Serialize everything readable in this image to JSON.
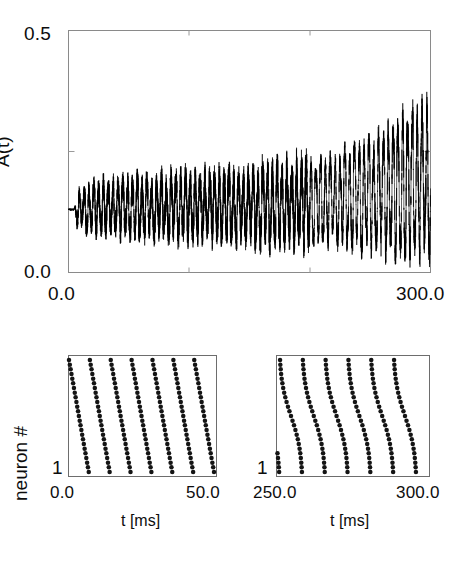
{
  "figure": {
    "title": "",
    "panels": [
      "activity-trace",
      "raster-early",
      "raster-late"
    ]
  },
  "top_panel": {
    "name": "population-activity",
    "ylabel": "A(t)",
    "y_ticks": [
      "0.0",
      "0.5"
    ],
    "x_ticks": [
      "0.0",
      "300.0"
    ],
    "ylim": [
      0.0,
      0.5
    ],
    "xlim": [
      0.0,
      300.0
    ]
  },
  "left_panel": {
    "name": "raster-early",
    "ylabel": "neuron #",
    "y_ticks": [
      "1"
    ],
    "x_ticks": [
      "0.0",
      "50.0"
    ],
    "xlabel": "t [ms]",
    "xlim": [
      0.0,
      50.0
    ]
  },
  "right_panel": {
    "name": "raster-late",
    "y_ticks": [
      "1"
    ],
    "x_ticks": [
      "250.0",
      "300.0"
    ],
    "xlabel": "t [ms]",
    "xlim": [
      250.0,
      300.0
    ]
  },
  "colors": {
    "trace": "#000000",
    "frame": "#8a8a8a",
    "dot": "#141414",
    "background": "#ffffff",
    "text": "#0d0d0d"
  },
  "chart_data": [
    {
      "type": "line",
      "name": "population-activity-trace",
      "title": "",
      "xlabel": "",
      "ylabel": "A(t)",
      "xlim": [
        0.0,
        300.0
      ],
      "ylim": [
        0.0,
        0.5
      ],
      "xticks": [
        0.0,
        300.0
      ],
      "yticks": [
        0.0,
        0.5
      ],
      "minor_xticks": [
        100.0,
        200.0
      ],
      "minor_yticks": [
        0.25
      ],
      "grid": false,
      "legend": null,
      "description": "Population activity A(t) of a network of spiking neurons. Starts at a flat steady value near 0.13 for t<5 ms, then develops noisy oscillations whose amplitude grows slowly until about t=200 ms and then grows rapidly, reaching peaks near 0.36 and troughs near 0.02 by t=300 ms.",
      "baseline": 0.13,
      "oscillation_period_ms": 4.0,
      "series": [
        {
          "name": "A(t)",
          "envelope_upper_x": [
            0,
            5,
            20,
            40,
            60,
            80,
            100,
            120,
            140,
            160,
            180,
            200,
            220,
            240,
            260,
            275,
            285,
            292,
            297,
            300
          ],
          "envelope_upper_y": [
            0.13,
            0.155,
            0.175,
            0.185,
            0.185,
            0.19,
            0.195,
            0.197,
            0.2,
            0.205,
            0.21,
            0.225,
            0.24,
            0.26,
            0.29,
            0.315,
            0.335,
            0.35,
            0.355,
            0.36
          ],
          "envelope_lower_x": [
            0,
            5,
            20,
            40,
            60,
            80,
            100,
            120,
            140,
            160,
            180,
            200,
            220,
            240,
            260,
            275,
            285,
            292,
            297,
            300
          ],
          "envelope_lower_y": [
            0.13,
            0.105,
            0.09,
            0.085,
            0.085,
            0.08,
            0.08,
            0.078,
            0.075,
            0.072,
            0.07,
            0.065,
            0.06,
            0.055,
            0.045,
            0.035,
            0.03,
            0.025,
            0.022,
            0.05
          ]
        }
      ]
    },
    {
      "type": "scatter",
      "name": "raster-early",
      "title": "",
      "xlabel": "t [ms]",
      "ylabel": "neuron #",
      "xlim": [
        0.0,
        50.0
      ],
      "ylim": [
        0.0,
        1.0
      ],
      "xticks": [
        0.0,
        50.0
      ],
      "yticks": [
        1
      ],
      "grid": false,
      "description": "Spike raster of 25 neurons over the first 50 ms. Seven nearly straight, steeply tilted stripes of spikes, each lasting about 7 ms and repeating every about 7 ms; neurons with higher index fire first, so the stripes slant down to the right.",
      "n_neurons": 25,
      "n_stripes": 7,
      "stripe_onsets_ms": [
        0.0,
        7.1,
        14.2,
        21.3,
        28.4,
        35.5,
        42.6
      ],
      "stripe_slope_ms_per_neuron": 0.28,
      "stripe_shape": "linear"
    },
    {
      "type": "scatter",
      "name": "raster-late",
      "title": "",
      "xlabel": "t [ms]",
      "ylabel": "",
      "xlim": [
        250.0,
        300.0
      ],
      "ylim": [
        0.0,
        1.0
      ],
      "xticks": [
        250.0,
        300.0
      ],
      "yticks": [
        1
      ],
      "grid": false,
      "description": "Spike raster of the same 25 neurons between 250 and 300 ms. Six full stripes plus a partial one at the left edge; stripes are S-shaped (curved) and more synchronous near the top, repeating every about 7.5 ms.",
      "n_neurons": 25,
      "n_stripes": 7,
      "stripe_onsets_ms": [
        243.5,
        251.0,
        258.5,
        266.0,
        273.5,
        281.0,
        288.5
      ],
      "stripe_shape": "sigmoid-curved"
    }
  ]
}
